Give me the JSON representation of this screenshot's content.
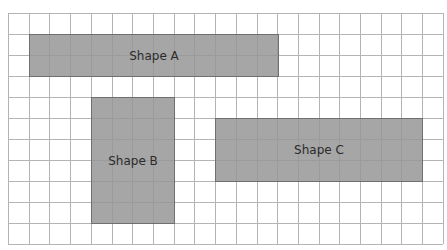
{
  "grid": {
    "cols": 21,
    "rows": 11,
    "cell_w": 20.71,
    "cell_h": 21,
    "line_color": "#b4b4b4",
    "origin": [
      8,
      13
    ]
  },
  "shapes": [
    {
      "label": "Shape A",
      "col": 1,
      "row": 1,
      "w": 12,
      "h": 2,
      "fill": "#999999"
    },
    {
      "label": "Shape B",
      "col": 4,
      "row": 4,
      "w": 4,
      "h": 6,
      "fill": "#999999"
    },
    {
      "label": "Shape C",
      "col": 10,
      "row": 5,
      "w": 10,
      "h": 3,
      "fill": "#999999"
    }
  ]
}
